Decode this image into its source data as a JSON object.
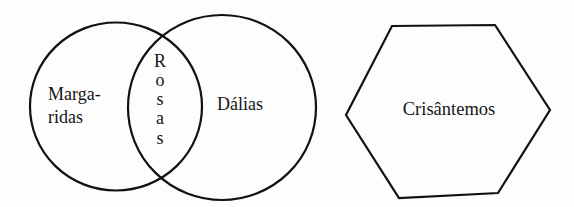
{
  "diagram": {
    "type": "venn-and-hexagon",
    "stroke_color": "#111111",
    "text_color": "#151515",
    "background": "#fdfdfd",
    "venn": {
      "left_set": {
        "label_line1": "Marga-",
        "label_line2": "ridas",
        "full_label": "Margaridas"
      },
      "right_set": {
        "label": "Dálias"
      },
      "intersection": {
        "label": "Rosas",
        "letters": [
          "R",
          "o",
          "s",
          "a",
          "s"
        ],
        "orientation": "vertical"
      }
    },
    "separate_set": {
      "shape": "hexagon",
      "label": "Crisântemos"
    }
  }
}
